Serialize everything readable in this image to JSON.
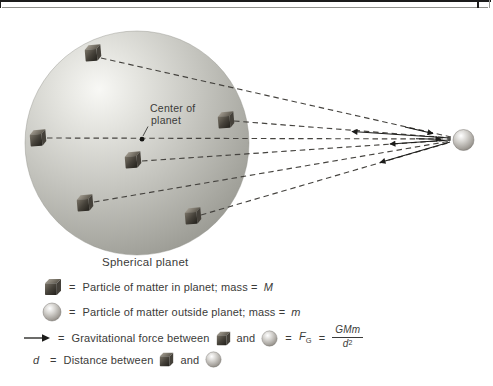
{
  "figure": {
    "center_label_line1": "Center of",
    "center_label_line2": "planet",
    "planet_caption": "Spherical planet"
  },
  "legend": {
    "particle_in": {
      "equals": "=",
      "text": "Particle of matter in planet; mass =",
      "symbol": "M"
    },
    "particle_out": {
      "equals": "=",
      "text": "Particle of matter outside planet; mass =",
      "symbol": "m"
    },
    "force": {
      "equals": "=",
      "text": "Gravitational force between",
      "and": "and",
      "equals2": "=",
      "force_symbol": "F",
      "force_subscript": "G",
      "equals3": "=",
      "fraction_numerator": "GMm",
      "fraction_denominator": "d",
      "fraction_exponent": "2"
    },
    "distance": {
      "symbol": "d",
      "equals": "=",
      "text": "Distance between",
      "and": "and"
    }
  },
  "icons": {
    "planet_particle": "dark-cube",
    "outside_particle": "gray-sphere",
    "force_arrow": "→"
  },
  "colors": {
    "planet_edge": "#8f8f88",
    "planet_highlight": "#f8f8f5",
    "cube_front_dark": "#211f1a",
    "cube_front_light": "#7a7468",
    "sphere_edge": "#716d66",
    "dashed_line": "#45433f",
    "arrow": "#1c1c1a",
    "text": "#3b3b39"
  }
}
